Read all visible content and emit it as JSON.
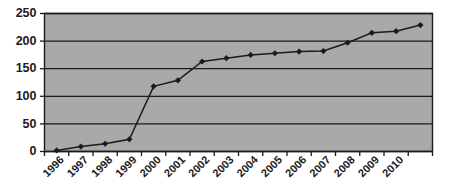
{
  "chart_data": {
    "type": "line",
    "title": "",
    "subtitle": "",
    "xlabel": "",
    "ylabel": "",
    "x": [
      1996,
      1997,
      1998,
      1999,
      2000,
      2001,
      2002,
      2003,
      2004,
      2005,
      2006,
      2007,
      2008,
      2009,
      2010,
      2011
    ],
    "categories": [
      "1996",
      "1997",
      "1998",
      "1999",
      "2000",
      "2001",
      "2002",
      "2003",
      "2004",
      "2005",
      "2006",
      "2007",
      "2008",
      "2009",
      "2010",
      ""
    ],
    "values": [
      2,
      9,
      14,
      22,
      118,
      129,
      163,
      169,
      175,
      178,
      181,
      182,
      197,
      215,
      218,
      229
    ],
    "series": [
      {
        "name": "",
        "values": [
          2,
          9,
          14,
          22,
          118,
          129,
          163,
          169,
          175,
          178,
          181,
          182,
          197,
          215,
          218,
          229
        ]
      }
    ],
    "ylim": [
      0,
      250
    ],
    "yticks": [
      0,
      50,
      100,
      150,
      200,
      250
    ],
    "ytick_labels": [
      "0",
      "50",
      "100",
      "150",
      "200",
      "250"
    ],
    "xtick_labels": [
      "1996",
      "1997",
      "1998",
      "1999",
      "2000",
      "2001",
      "2002",
      "2003",
      "2004",
      "2005",
      "2006",
      "2007",
      "2008",
      "2009",
      "2010"
    ],
    "grid": true,
    "grid_axis": "y",
    "legend": false,
    "legend_position": "none",
    "marker": "diamond",
    "xtick_label_rotation": 45,
    "colors": {
      "plot_background": "#a9a9a9",
      "grid_line": "#1b1b1b",
      "axis_line": "#1b1b1b",
      "series_line": "#1b1b1b",
      "marker_fill": "#1b1b1b",
      "page_background": "#ffffff",
      "tick_text": "#1b1b1b"
    },
    "annotations": []
  }
}
